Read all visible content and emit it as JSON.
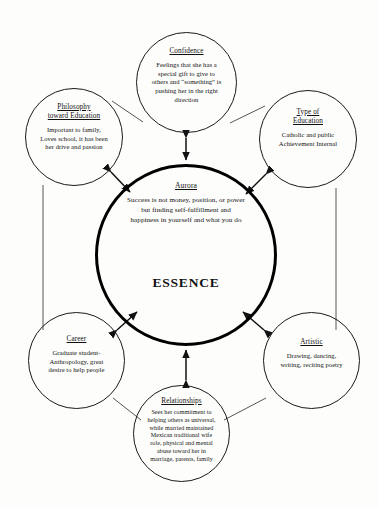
{
  "diagram": {
    "type": "hub-and-spoke concept map",
    "center": {
      "id": "essence",
      "title": "Aurora",
      "body": "Success is not money, position, or power\nbut finding self-fulfillment and\nhappiness in yourself and what you do",
      "label": "ESSENCE"
    },
    "nodes": [
      {
        "id": "confidence",
        "title": "Confidence",
        "body": "Feelings that she has a\nspecial gift to give to\nothers and “something” is\npushing her in the right\ndirection"
      },
      {
        "id": "philosophy",
        "title": "Philosophy\ntoward Education",
        "body": "Important to family,\nLoves school, it has been\nher drive and passion"
      },
      {
        "id": "typeofeducation",
        "title": "Type of\nEducation",
        "body": "Catholic and public\nAchievement Internal"
      },
      {
        "id": "career",
        "title": "Career",
        "body": "Graduate student-\nAnthropology, great\ndesire to help people"
      },
      {
        "id": "artistic",
        "title": "Artistic",
        "body": "Drawing, dancing,\nwriting, reciting poetry"
      },
      {
        "id": "relationships",
        "title": "Relationships",
        "body": "Sees her commitment to\nhelping others as universal,\nwhile married maintained\nMexican traditional wife\nrole, physical and mental\nabuse toward her in\nmarriage, parents, family"
      }
    ],
    "colors": {
      "stroke": "#1a1a1a",
      "hub_stroke": "#000000",
      "background": "#fdfdfc",
      "text": "#111111"
    }
  }
}
